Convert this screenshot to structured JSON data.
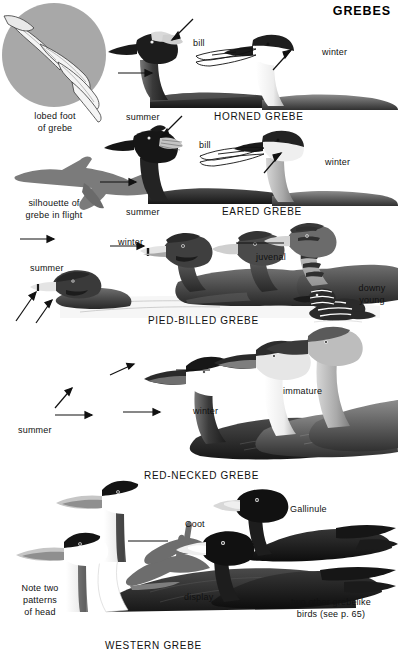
{
  "page": {
    "title": "GREBES",
    "width": 399,
    "height": 658,
    "background": "#ffffff",
    "ink": "#111111"
  },
  "figures": {
    "lobed_foot": {
      "caption_line1": "lobed foot",
      "caption_line2": "of grebe",
      "disc_color": "#a8a8a8"
    },
    "silhouette": {
      "caption_line1": "silhouette of",
      "caption_line2": "grebe in flight",
      "body_color": "#7b7b7b"
    }
  },
  "species": [
    {
      "name": "HORNED GREBE",
      "labels": [
        "summer",
        "bill",
        "winter"
      ]
    },
    {
      "name": "EARED GREBE",
      "labels": [
        "summer",
        "bill",
        "winter"
      ]
    },
    {
      "name": "PIED-BILLED GREBE",
      "labels": [
        "summer",
        "winter",
        "juvenal",
        "downy",
        "young"
      ]
    },
    {
      "name": "RED-NECKED GREBE",
      "labels": [
        "summer",
        "winter",
        "immature"
      ]
    },
    {
      "name": "WESTERN GREBE",
      "labels": [
        "Note two",
        "patterns",
        "of head",
        "display"
      ]
    }
  ],
  "labels": {
    "horned": {
      "summer": "summer",
      "bill": "bill",
      "winter": "winter",
      "species": "HORNED GREBE"
    },
    "eared": {
      "summer": "summer",
      "bill": "bill",
      "winter": "winter",
      "species": "EARED GREBE"
    },
    "pied": {
      "summer": "summer",
      "winter": "winter",
      "juvenal": "juvenal",
      "downy_line1": "downy",
      "downy_line2": "young",
      "species": "PIED-BILLED GREBE"
    },
    "rednecked": {
      "summer": "summer",
      "winter": "winter",
      "immature": "immature",
      "species": "RED-NECKED GREBE"
    },
    "western": {
      "note_line1": "Note two",
      "note_line2": "patterns",
      "note_line3": "of head",
      "display": "display",
      "species": "WESTERN GREBE"
    },
    "others": {
      "coot": "Coot",
      "gallinule": "Gallinule",
      "caption_line1": "two other grebelike",
      "caption_line2": "birds (see p. 65)"
    }
  },
  "colors": {
    "ink": "#111111",
    "dark_body": "#2b2b2b",
    "mid_gray": "#6e6e6e",
    "light_gray": "#c9c9c9",
    "white": "#ffffff",
    "silhouette": "#7b7b7b",
    "disc": "#a8a8a8"
  }
}
